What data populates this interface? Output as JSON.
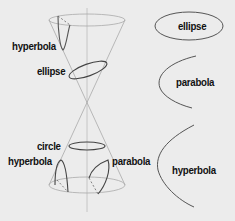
{
  "diagram": {
    "cone_labels": {
      "hyperbola_top": "hyperbola",
      "ellipse": "ellipse",
      "circle": "circle",
      "hyperbola_bottom": "hyperbola",
      "parabola": "parabola"
    },
    "curve_labels": {
      "ellipse": "ellipse",
      "parabola": "parabola",
      "hyperbola": "hyperbola"
    },
    "colors": {
      "background": "#ececec",
      "line": "#555555",
      "cone_line": "#aaaaaa",
      "text": "#111111"
    }
  }
}
